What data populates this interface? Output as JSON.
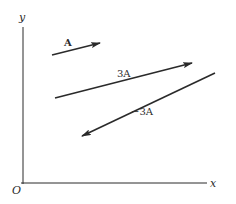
{
  "axes": {
    "x_label": "x",
    "y_label": "y",
    "origin_label": "O"
  },
  "vectors": [
    {
      "name": "A",
      "label": "A",
      "scale": 1,
      "from": [
        52,
        55
      ],
      "to": [
        100,
        43
      ]
    },
    {
      "name": "3A",
      "label": "3A",
      "scale": 3,
      "from": [
        55,
        98
      ],
      "to": [
        192,
        63
      ]
    },
    {
      "name": "-3A",
      "label": "−3A",
      "scale": -3,
      "from": [
        215,
        73
      ],
      "to": [
        82,
        136
      ]
    }
  ],
  "colors": {
    "line": "#2a2a2a",
    "background": "#ffffff"
  }
}
